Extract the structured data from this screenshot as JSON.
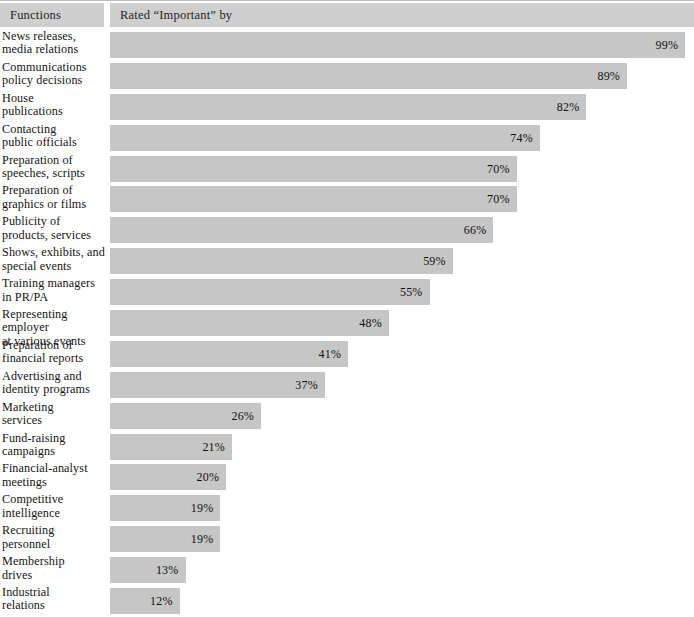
{
  "header": {
    "functions_label": "Functions",
    "rated_label": "Rated “Important” by"
  },
  "colors": {
    "bar_fill": "#c6c6c6",
    "header_fill": "#cfcfcf",
    "text": "#151515",
    "rule": "#bdbdbd",
    "background": "#ffffff"
  },
  "chart_data": {
    "type": "bar",
    "orientation": "horizontal",
    "title": "",
    "xlabel": "Rated “Important” by",
    "ylabel": "Functions",
    "xlim": [
      0,
      100
    ],
    "grid": false,
    "legend": false,
    "value_suffix": "%",
    "categories": [
      "News releases, media relations",
      "Communications policy decisions",
      "House publications",
      "Contacting public officials",
      "Preparation of speeches, scripts",
      "Preparation of graphics or films",
      "Publicity of products, services",
      "Shows, exhibits, and special events",
      "Training managers in PR/PA",
      "Representing employer at various events",
      "Preparation of financial reports",
      "Advertising and identity programs",
      "Marketing services",
      "Fund-raising campaigns",
      "Financial-analyst meetings",
      "Competitive intelligence",
      "Recruiting personnel",
      "Membership drives",
      "Industrial relations"
    ],
    "values": [
      99,
      89,
      82,
      74,
      70,
      70,
      66,
      59,
      55,
      48,
      41,
      37,
      26,
      21,
      20,
      19,
      19,
      13,
      12
    ]
  },
  "rows": [
    {
      "line1": "News releases,",
      "line2": "media relations",
      "value": 99,
      "value_label": "99%"
    },
    {
      "line1": "Communications",
      "line2": "policy decisions",
      "value": 89,
      "value_label": "89%"
    },
    {
      "line1": "House",
      "line2": "publications",
      "value": 82,
      "value_label": "82%"
    },
    {
      "line1": "Contacting",
      "line2": "public officials",
      "value": 74,
      "value_label": "74%"
    },
    {
      "line1": "Preparation of",
      "line2": "speeches, scripts",
      "value": 70,
      "value_label": "70%"
    },
    {
      "line1": "Preparation of",
      "line2": "graphics or films",
      "value": 70,
      "value_label": "70%"
    },
    {
      "line1": "Publicity of",
      "line2": "products, services",
      "value": 66,
      "value_label": "66%"
    },
    {
      "line1": "Shows, exhibits, and",
      "line2": "special events",
      "value": 59,
      "value_label": "59%"
    },
    {
      "line1": "Training managers",
      "line2": "in PR/PA",
      "value": 55,
      "value_label": "55%"
    },
    {
      "line1": "Representing employer",
      "line2": "at various events",
      "value": 48,
      "value_label": "48%"
    },
    {
      "line1": "Preparation of",
      "line2": "financial reports",
      "value": 41,
      "value_label": "41%"
    },
    {
      "line1": "Advertising and",
      "line2": "identity programs",
      "value": 37,
      "value_label": "37%"
    },
    {
      "line1": "Marketing",
      "line2": "services",
      "value": 26,
      "value_label": "26%"
    },
    {
      "line1": "Fund-raising",
      "line2": "campaigns",
      "value": 21,
      "value_label": "21%"
    },
    {
      "line1": "Financial-analyst",
      "line2": "meetings",
      "value": 20,
      "value_label": "20%"
    },
    {
      "line1": "Competitive",
      "line2": "intelligence",
      "value": 19,
      "value_label": "19%"
    },
    {
      "line1": "Recruiting",
      "line2": "personnel",
      "value": 19,
      "value_label": "19%"
    },
    {
      "line1": "Membership",
      "line2": "drives",
      "value": 13,
      "value_label": "13%"
    },
    {
      "line1": "Industrial",
      "line2": "relations",
      "value": 12,
      "value_label": "12%"
    }
  ],
  "scale": {
    "px_per_percent": 5.81,
    "bar_origin_x": 110
  }
}
